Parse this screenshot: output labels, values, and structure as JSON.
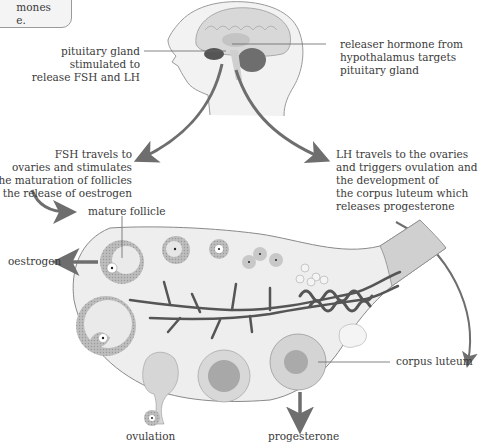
{
  "note_box": {
    "text_line1": "mones",
    "text_line2": "e."
  },
  "labels": {
    "pituitary": [
      "pituitary gland",
      "stimulated to",
      "release FSH and LH"
    ],
    "hypothalamus": [
      "releaser hormone from",
      "hypothalamus targets",
      "pituitary gland"
    ],
    "fsh": [
      "FSH travels to",
      "ovaries and stimulates",
      "the maturation of follicles",
      "and the release of oestrogen"
    ],
    "lh": [
      "LH travels to the ovaries",
      "and triggers ovulation and",
      "the development of",
      "the corpus luteum which",
      "releases progesterone"
    ],
    "mature_follicle": "mature follicle",
    "oestrogen": "oestrogen",
    "corpus_luteum": "corpus luteum",
    "ovulation": "ovulation",
    "progesterone": "progesterone"
  },
  "colors": {
    "arrow": "#6e6e6e",
    "ovary_fill": "#eeeeee",
    "outline": "#8a8a8a",
    "vessel": "#555555"
  }
}
